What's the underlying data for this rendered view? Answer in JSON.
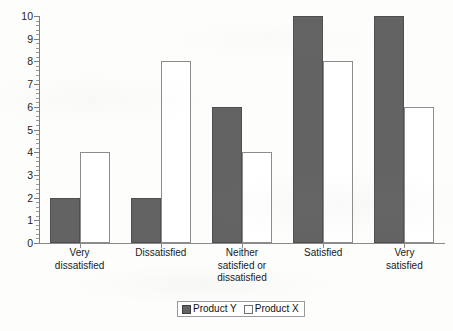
{
  "chart_data": {
    "type": "bar",
    "title": "",
    "subtitle": "",
    "xlabel": "",
    "ylabel": "",
    "ylim": [
      0,
      10
    ],
    "ytick_step": 1,
    "yticks": [
      "10",
      "9",
      "8",
      "7",
      "6",
      "5",
      "4",
      "3",
      "2",
      "1",
      "0"
    ],
    "minor_ticks": true,
    "grid": false,
    "legend_position": "bottom-center",
    "categories": [
      "Very dissatisfied",
      "Dissatisfied",
      "Neither satisfied or dissatisfied",
      "Satisfied",
      "Very satisfied"
    ],
    "category_lines": [
      [
        "Very",
        "dissatisfied"
      ],
      [
        "Dissatisfied"
      ],
      [
        "Neither",
        "satisfied or",
        "dissatisfied"
      ],
      [
        "Satisfied"
      ],
      [
        "Very",
        "satisfied"
      ]
    ],
    "series": [
      {
        "name": "Product Y",
        "color": "#636363",
        "style": "filled",
        "values": [
          2,
          2,
          6,
          10,
          10
        ]
      },
      {
        "name": "Product X",
        "color": "#ffffff",
        "style": "outlined",
        "values": [
          4,
          8,
          4,
          8,
          6
        ]
      }
    ]
  },
  "legend": {
    "entries": [
      {
        "label": "Product Y",
        "swatch": "filled-dark-gray"
      },
      {
        "label": "Product X",
        "swatch": "outlined-white"
      }
    ]
  },
  "colors": {
    "bar_fill_y": "#636363",
    "bar_border_y": "#4f4f4f",
    "bar_fill_x": "#ffffff",
    "bar_border_x": "#8c8c8c",
    "axis": "#8a8a8a",
    "text": "#1a1a1a",
    "background": "#fdfdfc"
  }
}
